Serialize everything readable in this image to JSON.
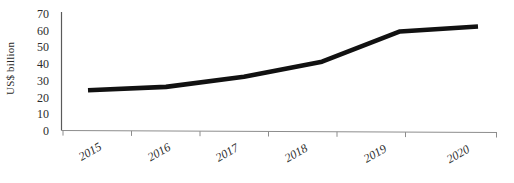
{
  "chart_data": {
    "type": "line",
    "title": "",
    "subtitle": "",
    "xlabel": "",
    "ylabel": "US$ billion",
    "categories": [
      "2015",
      "2016",
      "2017",
      "2018",
      "2019",
      "2020"
    ],
    "values": [
      24,
      26,
      32,
      41,
      59,
      62
    ],
    "series": [
      {
        "name": "US$ billion",
        "values": [
          24,
          26,
          32,
          41,
          59,
          62
        ]
      }
    ],
    "ylim": [
      0,
      70
    ],
    "ytick_labels": [
      "0",
      "10",
      "20",
      "30",
      "40",
      "50",
      "60",
      "70"
    ],
    "ytick_values": [
      0,
      10,
      20,
      30,
      40,
      50,
      60,
      70
    ],
    "grid": false,
    "legend": "none",
    "line_color": "#111111",
    "axis_color": "#8d8d8d",
    "text_color": "#2b2b2b",
    "annotations": []
  }
}
